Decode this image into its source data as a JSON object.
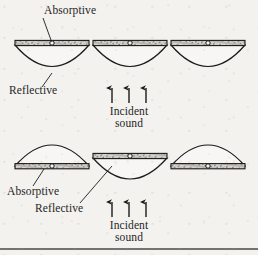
{
  "figure": {
    "background_color": "#f3f2ef",
    "ink_color": "#1b1b1b",
    "rows": [
      {
        "name": "top-row",
        "configuration": "absorptive-side-up",
        "panel_count": 3,
        "labels": {
          "absorptive": "Absorptive",
          "reflective": "Reflective",
          "incident_line1": "Incident",
          "incident_line2": "sound"
        },
        "arrow_count": 3,
        "arrow_direction": "up"
      },
      {
        "name": "bottom-row",
        "configuration": "alternating-flipped",
        "panel_count": 3,
        "labels": {
          "absorptive": "Absorptive",
          "reflective": "Reflective",
          "incident_line1": "Incident",
          "incident_line2": "sound"
        },
        "arrow_count": 3,
        "arrow_direction": "up"
      }
    ],
    "footer_rule": true
  }
}
